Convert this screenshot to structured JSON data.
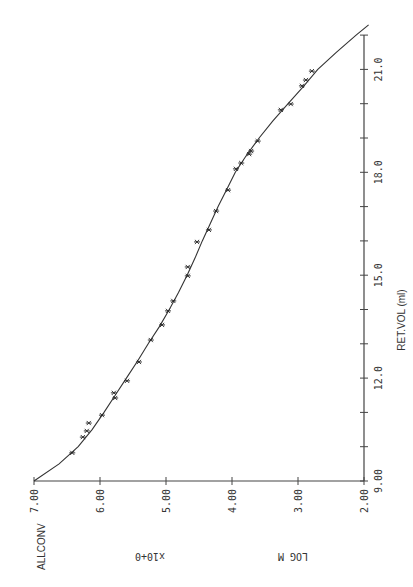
{
  "chart_data": {
    "type": "scatter",
    "title": "ALLCONV",
    "orientation": "rotated 90° counter-clockwise (x-axis vertical on right, y-axis horizontal at bottom)",
    "xlabel": "RET.VOL (ml)",
    "ylabel": "LOG M",
    "ylabel_scale": "x10+0",
    "xlim": [
      9.0,
      22.0
    ],
    "ylim": [
      2.0,
      7.0
    ],
    "x_ticks": [
      "9.00",
      "12.0",
      "15.0",
      "18.0",
      "21.0"
    ],
    "y_ticks": [
      "2.00",
      "3.00",
      "4.00",
      "5.00",
      "6.00",
      "7.00"
    ],
    "grid": false,
    "legend": null,
    "series": [
      {
        "name": "measured",
        "marker": "asterisk",
        "points": [
          [
            9.82,
            6.42
          ],
          [
            10.28,
            6.26
          ],
          [
            10.46,
            6.2
          ],
          [
            10.69,
            6.17
          ],
          [
            10.92,
            5.97
          ],
          [
            11.42,
            5.77
          ],
          [
            11.57,
            5.79
          ],
          [
            11.92,
            5.59
          ],
          [
            12.47,
            5.41
          ],
          [
            13.11,
            5.23
          ],
          [
            13.55,
            5.06
          ],
          [
            13.96,
            4.97
          ],
          [
            14.25,
            4.89
          ],
          [
            14.98,
            4.67
          ],
          [
            15.24,
            4.67
          ],
          [
            15.97,
            4.53
          ],
          [
            16.32,
            4.35
          ],
          [
            16.87,
            4.24
          ],
          [
            17.48,
            4.06
          ],
          [
            18.1,
            3.94
          ],
          [
            18.27,
            3.86
          ],
          [
            18.53,
            3.74
          ],
          [
            18.62,
            3.71
          ],
          [
            18.91,
            3.61
          ],
          [
            19.82,
            3.26
          ],
          [
            19.99,
            3.11
          ],
          [
            20.52,
            2.94
          ],
          [
            20.69,
            2.88
          ],
          [
            20.95,
            2.79
          ]
        ]
      },
      {
        "name": "calibration fit",
        "type": "line",
        "points": [
          [
            9.0,
            7.0
          ],
          [
            9.5,
            6.62
          ],
          [
            10.0,
            6.33
          ],
          [
            10.5,
            6.12
          ],
          [
            11.0,
            5.94
          ],
          [
            11.5,
            5.77
          ],
          [
            12.0,
            5.6
          ],
          [
            12.5,
            5.43
          ],
          [
            13.0,
            5.27
          ],
          [
            13.5,
            5.1
          ],
          [
            14.0,
            4.95
          ],
          [
            14.5,
            4.81
          ],
          [
            15.0,
            4.68
          ],
          [
            15.5,
            4.56
          ],
          [
            16.0,
            4.45
          ],
          [
            16.5,
            4.33
          ],
          [
            17.0,
            4.21
          ],
          [
            17.5,
            4.08
          ],
          [
            18.0,
            3.95
          ],
          [
            18.5,
            3.78
          ],
          [
            19.0,
            3.59
          ],
          [
            19.5,
            3.38
          ],
          [
            20.0,
            3.15
          ],
          [
            20.5,
            2.92
          ],
          [
            21.0,
            2.7
          ],
          [
            21.5,
            2.42
          ],
          [
            22.0,
            2.12
          ],
          [
            22.3,
            1.93
          ]
        ]
      }
    ]
  },
  "labels": {
    "title": "ALLCONV",
    "xlabel": "RET.VOL (ml)",
    "ylabel": "LOG M",
    "yscale": "x10+0"
  },
  "style": {
    "ink": "#333333",
    "axis": "#444444",
    "background": "#ffffff"
  }
}
